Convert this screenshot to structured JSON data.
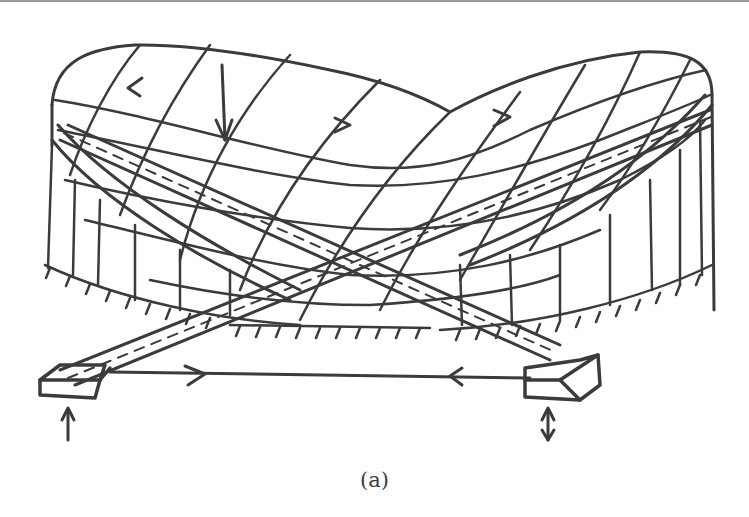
{
  "figure": {
    "caption": "(a)",
    "ink_color": "#3b3b3b",
    "background": "#ffffff",
    "elements": [
      "saddle-cable-net-roof",
      "perimeter-ring-cables",
      "vertical-wall-lines",
      "crossing-arches",
      "base-supports",
      "tie-cable",
      "force-arrows"
    ]
  }
}
